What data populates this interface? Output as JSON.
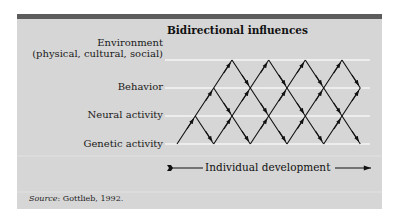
{
  "title": "Bidirectional influences",
  "levels": [
    {
      "label": "Environment",
      "sublabel": "(physical, cultural, social)"
    },
    {
      "label": "Behavior"
    },
    {
      "label": "Neural activity"
    },
    {
      "label": "Genetic activity"
    }
  ],
  "axis": {
    "label": "Individual development"
  },
  "source": {
    "prefix": "Source",
    "text": ": Gottlieb, 1992."
  },
  "colors": {
    "panel": "#d6d6d6",
    "topbar": "#5c5c5c",
    "guide_lines": "#f4f4f4",
    "arrows": "#111111"
  }
}
